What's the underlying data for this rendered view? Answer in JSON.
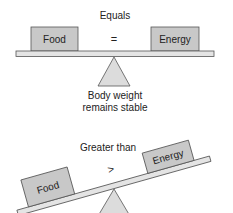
{
  "colors": {
    "box_fill": "#c8c8c8",
    "box_stroke": "#555555",
    "beam_fill": "#e4e4e4",
    "fulcrum_fill": "#dcdcdc",
    "text": "#222222"
  },
  "balanced": {
    "title": "Equals",
    "left_box": "Food",
    "operator": "=",
    "right_box": "Energy",
    "caption_line1": "Body weight",
    "caption_line2": "remains stable"
  },
  "tilted": {
    "title": "Greater than",
    "left_box": "Food",
    "operator": ">",
    "right_box": "Energy"
  }
}
